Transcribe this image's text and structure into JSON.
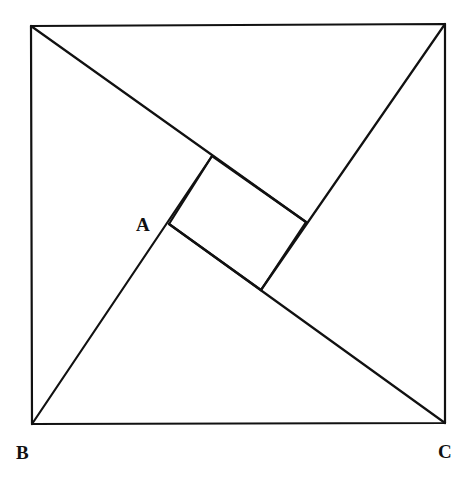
{
  "diagram": {
    "title": "",
    "stroke_color": "#111111",
    "background": "#ffffff",
    "outer_square": {
      "top_left": [
        31,
        26
      ],
      "top_right": [
        445,
        24
      ],
      "bottom_right": [
        445,
        423
      ],
      "bottom_left": [
        32,
        424
      ]
    },
    "inner_square": {
      "top": [
        212,
        156
      ],
      "right": [
        306,
        222
      ],
      "bottom": [
        261,
        290
      ],
      "left": [
        169,
        224
      ]
    },
    "segments": [
      {
        "name": "diagonal-from-top-left",
        "from": [
          31,
          26
        ],
        "to": [
          306,
          222
        ]
      },
      {
        "name": "diagonal-from-top-right",
        "from": [
          445,
          24
        ],
        "to": [
          261,
          290
        ]
      },
      {
        "name": "diagonal-from-bottom-right",
        "from": [
          445,
          423
        ],
        "to": [
          169,
          224
        ]
      },
      {
        "name": "diagonal-from-bottom-left",
        "from": [
          32,
          424
        ],
        "to": [
          212,
          156
        ]
      }
    ],
    "labels": [
      {
        "id": "A",
        "text": "A",
        "x": 136,
        "y": 231
      },
      {
        "id": "B",
        "text": "B",
        "x": 16,
        "y": 459
      },
      {
        "id": "C",
        "text": "C",
        "x": 438,
        "y": 458
      }
    ]
  }
}
